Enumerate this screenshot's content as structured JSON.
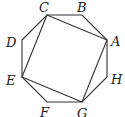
{
  "diagram": {
    "octagon": {
      "vertices": [
        {
          "name": "A",
          "x": 107,
          "y": 40
        },
        {
          "name": "B",
          "x": 82,
          "y": 15
        },
        {
          "name": "C",
          "x": 47,
          "y": 15
        },
        {
          "name": "D",
          "x": 22,
          "y": 40
        },
        {
          "name": "E",
          "x": 22,
          "y": 77
        },
        {
          "name": "F",
          "x": 47,
          "y": 102
        },
        {
          "name": "G",
          "x": 82,
          "y": 102
        },
        {
          "name": "H",
          "x": 107,
          "y": 77
        }
      ]
    },
    "square": {
      "vertices": [
        "C",
        "A",
        "G",
        "E"
      ]
    },
    "labels": [
      {
        "text": "A",
        "x": 111,
        "y": 46
      },
      {
        "text": "B",
        "x": 77,
        "y": 12
      },
      {
        "text": "C",
        "x": 39,
        "y": 12
      },
      {
        "text": "D",
        "x": 6,
        "y": 47
      },
      {
        "text": "E",
        "x": 6,
        "y": 85
      },
      {
        "text": "F",
        "x": 40,
        "y": 117
      },
      {
        "text": "G",
        "x": 77,
        "y": 118
      },
      {
        "text": "H",
        "x": 111,
        "y": 84
      }
    ],
    "colors": {
      "stroke": "#333333",
      "label": "#222222",
      "background": "#ffffff"
    }
  }
}
